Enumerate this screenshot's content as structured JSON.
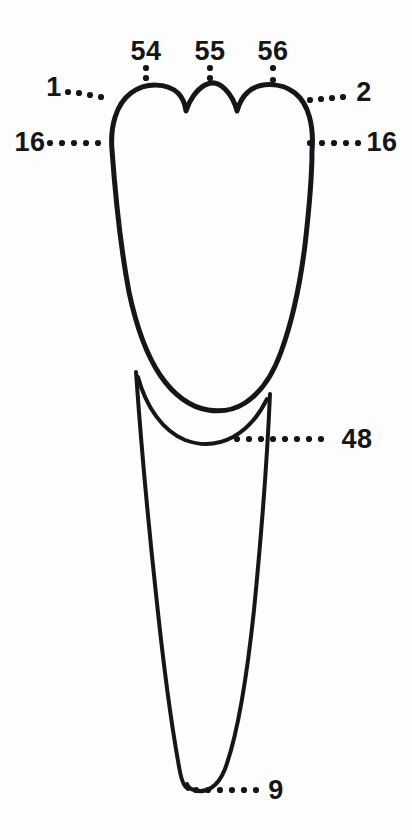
{
  "figure": {
    "title": "Maxillary central incisor, labial view with numbered landmark callouts",
    "background_color": "#fdfdfd",
    "ink_color": "#16161a",
    "view": "labial",
    "callouts": [
      {
        "id": "callout-54",
        "label": "54",
        "landmark": "mesial-mamelon",
        "text_x": 146,
        "text_y": 60,
        "anchor": "middle",
        "leader": "vertical",
        "dots": [
          [
            146,
            68
          ],
          [
            146,
            78
          ]
        ]
      },
      {
        "id": "callout-55",
        "label": "55",
        "landmark": "middle-mamelon",
        "text_x": 210,
        "text_y": 60,
        "anchor": "middle",
        "leader": "vertical",
        "dots": [
          [
            210,
            68
          ],
          [
            210,
            78
          ]
        ]
      },
      {
        "id": "callout-56",
        "label": "56",
        "landmark": "distal-mamelon",
        "text_x": 273,
        "text_y": 60,
        "anchor": "middle",
        "leader": "vertical",
        "dots": [
          [
            273,
            68
          ],
          [
            273,
            80
          ]
        ]
      },
      {
        "id": "callout-1",
        "label": "1",
        "landmark": "mesioincisal-angle",
        "text_x": 54,
        "text_y": 96,
        "anchor": "middle",
        "leader": "horizontal",
        "dots": [
          [
            68,
            92
          ],
          [
            79,
            93
          ],
          [
            90,
            95
          ],
          [
            101,
            97
          ]
        ]
      },
      {
        "id": "callout-2",
        "label": "2",
        "landmark": "distoincisal-angle",
        "text_x": 364,
        "text_y": 101,
        "anchor": "middle",
        "leader": "horizontal",
        "dots": [
          [
            310,
            100
          ],
          [
            321,
            99
          ],
          [
            332,
            98
          ],
          [
            343,
            97
          ]
        ]
      },
      {
        "id": "callout-16-mesial",
        "label": "16",
        "landmark": "mesial-contact-area",
        "text_x": 30,
        "text_y": 151,
        "anchor": "middle",
        "leader": "horizontal",
        "dots": [
          [
            50,
            143
          ],
          [
            62,
            143
          ],
          [
            74,
            143
          ],
          [
            86,
            143
          ],
          [
            98,
            143
          ]
        ]
      },
      {
        "id": "callout-16-distal",
        "label": "16",
        "landmark": "distal-contact-area",
        "text_x": 382,
        "text_y": 151,
        "anchor": "middle",
        "leader": "horizontal",
        "dots": [
          [
            310,
            143
          ],
          [
            322,
            143
          ],
          [
            334,
            143
          ],
          [
            346,
            143
          ],
          [
            358,
            143
          ]
        ]
      },
      {
        "id": "callout-48",
        "label": "48",
        "landmark": "cervical-line-cej",
        "text_x": 357,
        "text_y": 448,
        "anchor": "middle",
        "leader": "horizontal",
        "dots": [
          [
            237,
            439
          ],
          [
            249,
            439
          ],
          [
            261,
            439
          ],
          [
            273,
            439
          ],
          [
            285,
            439
          ],
          [
            297,
            439
          ],
          [
            309,
            439
          ],
          [
            321,
            439
          ]
        ]
      },
      {
        "id": "callout-9",
        "label": "9",
        "landmark": "root-apex",
        "text_x": 276,
        "text_y": 799,
        "anchor": "middle",
        "leader": "horizontal",
        "dots": [
          [
            196,
            790
          ],
          [
            208,
            790
          ],
          [
            220,
            790
          ],
          [
            232,
            790
          ],
          [
            244,
            790
          ],
          [
            256,
            790
          ]
        ]
      }
    ],
    "outlines": [
      {
        "name": "crown-and-root-silhouette",
        "stroke_width": 5,
        "path": "M 112 150 C 110 127 116 104 131 93 C 146 82 167 83 178 93 C 183 98 185 104 186 111 C 189 101 196 90 205 85 C 212 81 219 83 225 89 C 231 95 235 103 237 111 C 239 104 242 97 248 92 C 259 82 281 82 295 93 C 309 104 314 127 312 151 C 312 175 309 210 305 245 C 300 285 292 322 281 352 C 272 377 259 394 245 403 C 234 410 220 412 208 410 C 190 407 173 394 160 375 C 146 354 136 325 129 292 C 122 255 116 205 112 150 Z"
      },
      {
        "name": "cervical-line-cej",
        "stroke_width": 4,
        "path": "M 138 377 C 146 407 163 431 185 440 C 201 446 218 445 233 437 C 248 429 259 415 267 399"
      },
      {
        "name": "root-mesial-border",
        "stroke_width": 4,
        "path": "M 136 372 C 141 443 148 520 156 594 C 163 661 171 724 180 772 C 182 782 184 787 188 789"
      },
      {
        "name": "root-distal-border",
        "stroke_width": 4,
        "path": "M 270 394 C 267 463 261 539 254 610 C 247 676 238 734 225 769 C 218 787 206 794 194 790 C 190 789 188 787 187 784"
      }
    ]
  }
}
